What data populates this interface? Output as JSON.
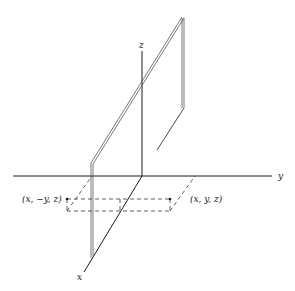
{
  "figure": {
    "axes": {
      "x_label": "x",
      "y_label": "y",
      "z_label": "z"
    },
    "points": {
      "point_right": "(x, y, z)",
      "point_left": "(x, −y, z)"
    },
    "colors": {
      "line": "#1a1a1a",
      "background": "#ffffff"
    }
  }
}
